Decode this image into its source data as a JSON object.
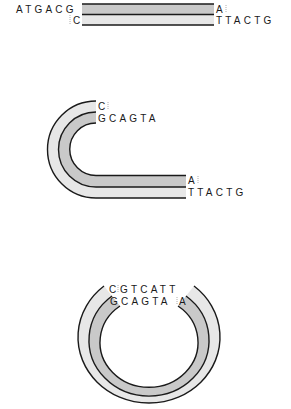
{
  "colors": {
    "outline": "#1a1a1a",
    "strand_dark": "#c9c9c9",
    "strand_light": "#e7e7e7",
    "background": "#ffffff"
  },
  "panels": [
    {
      "name": "linear-dna",
      "top_left_seq": "ATGACG",
      "bottom_left_seq": "C",
      "top_right_seq": "A",
      "bottom_right_seq": "TTACTG"
    },
    {
      "name": "bent-dna",
      "top_left_seq_outer": "C",
      "top_left_seq_inner": "GCAGTA",
      "bottom_right_seq_inner": "A",
      "bottom_right_seq_outer": "TTACTG"
    },
    {
      "name": "circular-dna",
      "top_seq_outer_left": "C",
      "top_seq_outer_right": "GTCATT",
      "top_seq_inner_left": "GCAGTA",
      "top_seq_inner_right": "A"
    }
  ]
}
